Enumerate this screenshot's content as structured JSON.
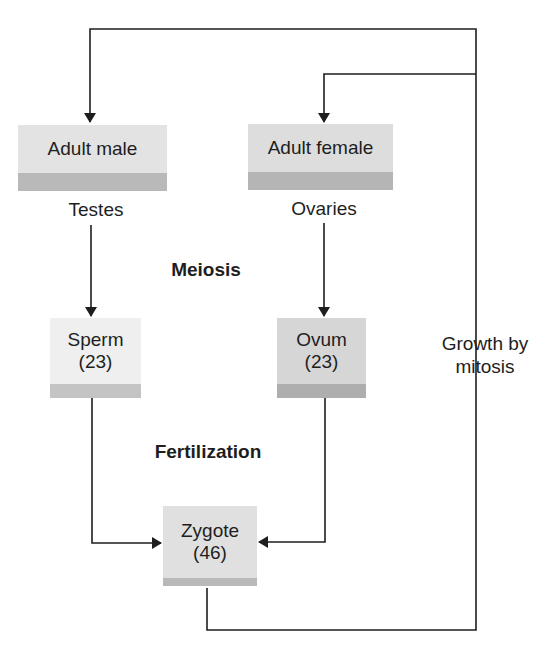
{
  "diagram": {
    "nodes": {
      "adult_male": {
        "label": "Adult male"
      },
      "adult_female": {
        "label": "Adult female"
      },
      "sperm": {
        "label": "Sperm",
        "count": "(23)"
      },
      "ovum": {
        "label": "Ovum",
        "count": "(23)"
      },
      "zygote": {
        "label": "Zygote",
        "count": "(46)"
      }
    },
    "labels": {
      "testes": "Testes",
      "ovaries": "Ovaries",
      "meiosis": "Meiosis",
      "fertilization": "Fertilization",
      "growth_line1": "Growth by",
      "growth_line2": "mitosis"
    },
    "colors": {
      "box_light": "#ececec",
      "box_mid": "#dedede",
      "shadow": "#b9b9b9",
      "line": "#1e1e1e"
    },
    "edges": [
      {
        "from": "adult_male",
        "to": "sperm",
        "via": "Testes"
      },
      {
        "from": "adult_female",
        "to": "ovum",
        "via": "Ovaries"
      },
      {
        "from": "sperm",
        "to": "zygote"
      },
      {
        "from": "ovum",
        "to": "zygote"
      },
      {
        "from": "zygote",
        "to": "adult_male",
        "via": "Growth by mitosis"
      },
      {
        "from": "zygote",
        "to": "adult_female",
        "via": "Growth by mitosis"
      }
    ]
  }
}
